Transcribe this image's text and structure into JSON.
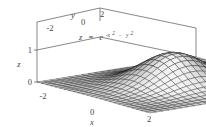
{
  "figure": {
    "kind": "3d-surface-plot",
    "background": "#ffffff",
    "frame_color": "#555555",
    "text_color": "#444444"
  },
  "equation": {
    "lhs": "z",
    "eq": "=",
    "base": "e",
    "exp_neg_x": "-x",
    "exp_x_pow": "2",
    "exp_minus": "−",
    "exp_y": "y",
    "exp_y_pow": "2",
    "plain": "z = e^(-x^2 - y^2)"
  },
  "axes": {
    "x": {
      "label": "x",
      "ticks": [
        "-2",
        "0",
        "2"
      ],
      "range": [
        -2,
        2
      ]
    },
    "y": {
      "label": "y",
      "ticks": [
        "-2",
        "0",
        "2"
      ],
      "range": [
        -2,
        2
      ]
    },
    "z": {
      "label": "z",
      "ticks": [
        "0",
        "1"
      ],
      "range": [
        0,
        1
      ]
    }
  },
  "chart_data": {
    "type": "surface",
    "title": "",
    "annotations": [
      "z = e^(-x^2 - y^2)"
    ],
    "xlabel": "x",
    "ylabel": "y",
    "zlabel": "z",
    "xlim": [
      -2,
      2
    ],
    "ylim": [
      -2,
      2
    ],
    "zlim": [
      0,
      1
    ],
    "xticks": [
      -2,
      0,
      2
    ],
    "yticks": [
      -2,
      0,
      2
    ],
    "zticks": [
      0,
      1
    ],
    "function": "exp(-(x*x + y*y))",
    "mesh_n": 25,
    "grid": true,
    "legend": "none",
    "peak": {
      "x": 0,
      "y": 0,
      "z": 1
    }
  }
}
